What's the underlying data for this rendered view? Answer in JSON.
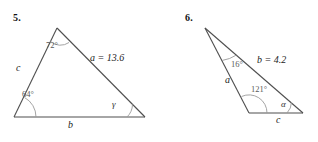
{
  "page": {
    "background_color": "#ffffff",
    "line_color": "#4a4a4a",
    "arc_color": "#8a8a8a",
    "width": 318,
    "height": 142
  },
  "figures": [
    {
      "number_label": "5.",
      "shape": "triangle",
      "vertices": {
        "apex": [
          57,
          28
        ],
        "bottom_left": [
          14,
          117
        ],
        "bottom_right": [
          145,
          117
        ]
      },
      "angle_labels": [
        {
          "name": "apex-angle",
          "text": "72°"
        },
        {
          "name": "bottom-left-angle",
          "text": "64°"
        },
        {
          "name": "bottom-right-angle",
          "text": "γ"
        }
      ],
      "side_labels": [
        {
          "name": "side-c",
          "text": "c"
        },
        {
          "name": "side-b",
          "text": "b"
        },
        {
          "name": "side-a",
          "text": "a",
          "value": "= 13.6",
          "full": "a = 13.6"
        }
      ]
    },
    {
      "number_label": "6.",
      "shape": "triangle",
      "vertices": {
        "apex": [
          205,
          28
        ],
        "bottom_left": [
          249,
          113
        ],
        "bottom_right": [
          303,
          113
        ]
      },
      "angle_labels": [
        {
          "name": "apex-angle",
          "text": "16°"
        },
        {
          "name": "bottom-left-angle",
          "text": "121°"
        },
        {
          "name": "bottom-right-angle",
          "text": "α"
        }
      ],
      "side_labels": [
        {
          "name": "side-a",
          "text": "a"
        },
        {
          "name": "side-c",
          "text": "c"
        },
        {
          "name": "side-b",
          "text": "b",
          "value": "= 4.2",
          "full": "b = 4.2"
        }
      ]
    }
  ]
}
